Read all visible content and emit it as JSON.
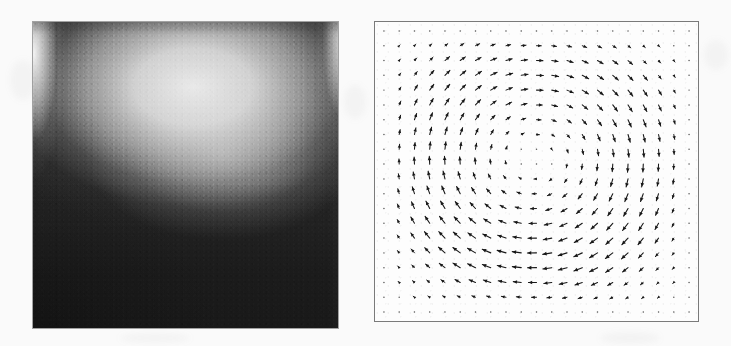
{
  "figure": {
    "caption": "",
    "background_color": "#fafafa",
    "panel_count": 2
  },
  "panels": [
    {
      "id": "magnitude-panel",
      "name": "velocity-magnitude-contour",
      "label": "",
      "type": "heatmap",
      "colormap": "grayscale",
      "colormap_low": "#202020",
      "colormap_high": "#f2f2f2",
      "border_color": "#5a5a5a",
      "geometry": {
        "x": 33,
        "y": 22,
        "width": 305,
        "height": 306
      },
      "description": "Grayscale density field; bright crescent-shaped band arcs downward from the two upper corners across the upper-middle of the square, dark elsewhere, darkest toward the lower-left."
    },
    {
      "id": "vector-panel",
      "name": "velocity-vector-field",
      "label": "",
      "type": "quiver",
      "border_color": "#7a7a7a",
      "background_color": "#fdfdfd",
      "arrow_color": "#181818",
      "geometry": {
        "x": 374,
        "y": 21,
        "width": 325,
        "height": 301
      },
      "description": "Quiver plot of a single clockwise vortex centred slightly left of and above the box centre; arrows vanish to dots at the walls and at the vortex core."
    }
  ],
  "chart_data": {
    "type": "quiver",
    "xlabel": "",
    "ylabel": "",
    "xlim": [
      0,
      1
    ],
    "ylim": [
      0,
      1
    ],
    "grid": false,
    "legend": "none",
    "axis_ticks": [],
    "grid_nx": 21,
    "grid_ny": 20,
    "rotation": "clockwise",
    "vortex_center": {
      "x": 0.495,
      "y": 0.545
    },
    "vortex_core_radius": 0.07,
    "max_arrow_length_px": 17,
    "companion_field": {
      "type": "heatmap",
      "title": "Velocity magnitude",
      "colormap": "grayscale",
      "vmin": 0.0,
      "vmax": 1.0,
      "bright_band_center": {
        "x": 0.52,
        "y": 0.26
      },
      "hot_corners": [
        {
          "x": 0.085,
          "y": 0.17
        },
        {
          "x": 0.93,
          "y": 0.14
        }
      ]
    }
  }
}
